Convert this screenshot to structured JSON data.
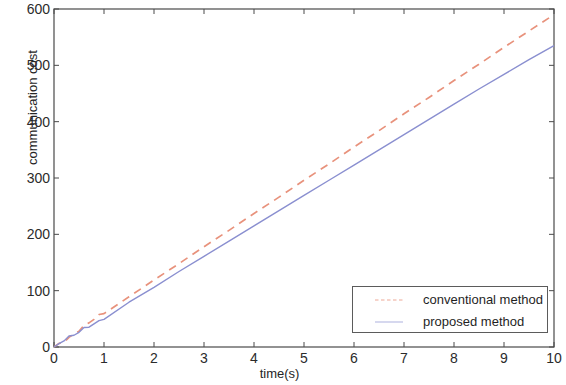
{
  "chart_data": {
    "type": "line",
    "title": "",
    "xlabel": "time(s)",
    "ylabel": "communication cost",
    "xlim": [
      0,
      10
    ],
    "ylim": [
      0,
      600
    ],
    "xticks": [
      "0",
      "1",
      "2",
      "3",
      "4",
      "5",
      "6",
      "7",
      "8",
      "9",
      "10"
    ],
    "yticks": [
      "0",
      "100",
      "200",
      "300",
      "400",
      "500",
      "600"
    ],
    "grid": false,
    "legend_position": "lower right",
    "series": [
      {
        "name": "conventional method",
        "color": "#e8927c",
        "style": "dashed",
        "x": [
          0,
          0.1,
          0.2,
          0.3,
          0.4,
          0.5,
          0.6,
          0.7,
          0.8,
          0.9,
          1.0,
          1.5,
          2.0,
          2.5,
          3.0,
          3.5,
          4.0,
          4.5,
          5.0,
          5.5,
          6.0,
          6.5,
          7.0,
          7.5,
          8.0,
          8.5,
          9.0,
          9.5,
          10.0
        ],
        "values": [
          0,
          6,
          12,
          18,
          24,
          30,
          36,
          42,
          48,
          54,
          60,
          89,
          119,
          148,
          178,
          207,
          237,
          266,
          296,
          325,
          355,
          384,
          414,
          443,
          473,
          502,
          532,
          561,
          590
        ]
      },
      {
        "name": "proposed method",
        "color": "#8a8fd0",
        "style": "solid",
        "x": [
          0,
          0.1,
          0.2,
          0.3,
          0.4,
          0.5,
          0.6,
          0.7,
          0.8,
          0.9,
          1.0,
          1.5,
          2.0,
          2.5,
          3.0,
          3.5,
          4.0,
          4.5,
          5.0,
          5.5,
          6.0,
          6.5,
          7.0,
          7.5,
          8.0,
          8.5,
          9.0,
          9.5,
          10.0
        ],
        "values": [
          0,
          7,
          13,
          17,
          20,
          25,
          31,
          36,
          41,
          47,
          53,
          80,
          107,
          134,
          161,
          188,
          215,
          242,
          269,
          296,
          323,
          350,
          377,
          404,
          431,
          458,
          484,
          510,
          535
        ]
      }
    ]
  },
  "legend": {
    "items": [
      {
        "label": "conventional method"
      },
      {
        "label": "proposed method"
      }
    ]
  }
}
